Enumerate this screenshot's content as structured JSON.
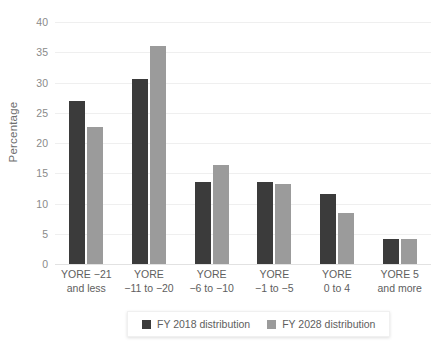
{
  "chart_data": {
    "type": "bar",
    "title": "",
    "subtitle": "",
    "xlabel": "",
    "ylabel": "Percentage",
    "ylim": [
      0,
      40
    ],
    "yticks": [
      0,
      5,
      10,
      15,
      20,
      25,
      30,
      35,
      40
    ],
    "ytick_labels": [
      "0",
      "5",
      "10",
      "15",
      "20",
      "25",
      "30",
      "35",
      "40"
    ],
    "grid": true,
    "legend_position": "bottom",
    "categories": [
      "YORE −21 and less",
      "YORE −11 to −20",
      "YORE −6 to −10",
      "YORE −1 to −5",
      "YORE 0 to 4",
      "YORE 5 and more"
    ],
    "category_lines": [
      [
        "YORE −21",
        "and less"
      ],
      [
        "YORE",
        "−11 to −20"
      ],
      [
        "YORE",
        "−6 to −10"
      ],
      [
        "YORE",
        "−1 to −5"
      ],
      [
        "YORE",
        "0 to 4"
      ],
      [
        "YORE 5",
        "and more"
      ]
    ],
    "series": [
      {
        "name": "FY 2018 distribution",
        "color": "#3b3b3b",
        "values": [
          27.0,
          30.6,
          13.6,
          13.6,
          11.5,
          4.1
        ]
      },
      {
        "name": "FY 2028 distribution",
        "color": "#9b9b9b",
        "values": [
          22.6,
          36.1,
          16.4,
          13.2,
          8.5,
          4.1
        ]
      }
    ]
  },
  "colors": {
    "series_2018": "#3b3b3b",
    "series_2028": "#9b9b9b",
    "gridline": "#efefef",
    "axis_text": "#8a8a8a",
    "label_text": "#5e5e5e",
    "background": "#ffffff"
  }
}
